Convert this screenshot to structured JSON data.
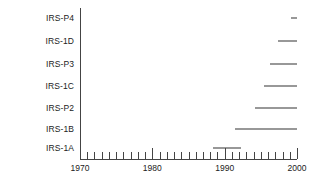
{
  "chart_data": {
    "type": "bar",
    "orientation": "horizontal-timeline",
    "title": "",
    "subtitle": "",
    "xlabel": "",
    "ylabel": "",
    "xlim": [
      1970,
      2000
    ],
    "xtick_step": 1,
    "xtick_labels": [
      "1970",
      "1980",
      "1990",
      "2000"
    ],
    "xtick_label_values": [
      1970,
      1980,
      1990,
      2000
    ],
    "grid": false,
    "legend": null,
    "categories": [
      "IRS-P4",
      "IRS-1D",
      "IRS-P3",
      "IRS-1C",
      "IRS-P2",
      "IRS-1B",
      "IRS-1A"
    ],
    "bars": [
      {
        "label": "IRS-P4",
        "start": 1999.2,
        "end": 2000.0
      },
      {
        "label": "IRS-1D",
        "start": 1997.4,
        "end": 2000.0
      },
      {
        "label": "IRS-P3",
        "start": 1996.3,
        "end": 2000.0
      },
      {
        "label": "IRS-1C",
        "start": 1995.4,
        "end": 2000.0
      },
      {
        "label": "IRS-P2",
        "start": 1994.2,
        "end": 2000.0
      },
      {
        "label": "IRS-1B",
        "start": 1991.4,
        "end": 2000.0
      },
      {
        "label": "IRS-1A",
        "start": 1988.4,
        "end": 1992.2
      }
    ]
  },
  "colors": {
    "bar": "#333333",
    "axis": "#444444",
    "text": "#222222",
    "background": "#ffffff"
  }
}
